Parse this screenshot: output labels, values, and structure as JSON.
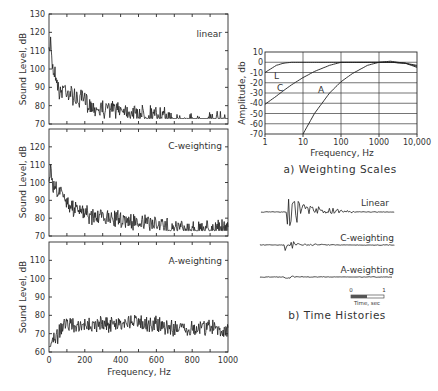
{
  "chart_data": [
    {
      "type": "line",
      "panel": "linear",
      "title": "linear",
      "xlabel": "",
      "ylabel": "Sound Level, dB",
      "xlim": [
        0,
        1000
      ],
      "ylim": [
        70,
        130
      ],
      "yticks": [
        70,
        80,
        90,
        100,
        110,
        120,
        130
      ],
      "grid": false,
      "x": [
        0,
        10,
        20,
        40,
        60,
        80,
        100,
        150,
        200,
        250,
        300,
        400,
        500,
        600,
        700,
        800,
        900,
        1000
      ],
      "values": [
        110,
        120,
        105,
        100,
        90,
        95,
        92,
        88,
        86,
        83,
        82,
        82,
        80,
        79,
        76,
        75,
        76,
        75
      ]
    },
    {
      "type": "line",
      "panel": "C-weighting",
      "title": "C-weighting",
      "ylabel": "Sound Level, dB",
      "xlim": [
        0,
        1000
      ],
      "ylim": [
        70,
        130
      ],
      "yticks": [
        70,
        80,
        90,
        100,
        110,
        120
      ],
      "grid": false,
      "x": [
        0,
        10,
        20,
        40,
        60,
        80,
        100,
        150,
        200,
        250,
        300,
        400,
        500,
        600,
        700,
        800,
        900,
        1000
      ],
      "values": [
        100,
        113,
        102,
        100,
        98,
        96,
        92,
        88,
        86,
        84,
        84,
        83,
        81,
        80,
        78,
        77,
        78,
        77
      ]
    },
    {
      "type": "line",
      "panel": "A-weighting",
      "title": "A-weighting",
      "xlabel": "Frequency, Hz",
      "ylabel": "Sound Level, dB",
      "xlim": [
        0,
        1000
      ],
      "ylim": [
        60,
        120
      ],
      "yticks": [
        60,
        70,
        80,
        90,
        100,
        110
      ],
      "xticks": [
        0,
        200,
        400,
        600,
        800,
        1000
      ],
      "grid": false,
      "x": [
        0,
        10,
        20,
        40,
        60,
        80,
        100,
        150,
        200,
        250,
        300,
        400,
        500,
        600,
        700,
        800,
        900,
        1000
      ],
      "values": [
        65,
        66,
        68,
        72,
        74,
        78,
        80,
        76,
        77,
        79,
        78,
        79,
        80,
        78,
        76,
        76,
        77,
        75
      ]
    },
    {
      "type": "line",
      "panel": "weighting-scales",
      "title": "a) Weighting Scales",
      "xlabel": "Frequency, Hz",
      "ylabel": "Amplitude, db",
      "xscale": "log",
      "xlim": [
        1,
        10000
      ],
      "ylim": [
        -70,
        10
      ],
      "xticks": [
        "1",
        "10",
        "100",
        "1000",
        "10,000"
      ],
      "yticks": [
        10,
        0,
        -10,
        -20,
        -30,
        -40,
        -50,
        -60,
        -70
      ],
      "grid": true,
      "x": [
        1,
        2,
        3,
        5,
        10,
        20,
        50,
        100,
        200,
        500,
        1000,
        2000,
        5000,
        10000
      ],
      "series": [
        {
          "name": "L",
          "values": [
            -10,
            -3,
            -1,
            0,
            0,
            0,
            0,
            0,
            0,
            0,
            0,
            0,
            -1,
            -3
          ]
        },
        {
          "name": "C",
          "values": [
            -41,
            -33,
            -28,
            -22,
            -15,
            -9,
            -3,
            0,
            0,
            0,
            0,
            0,
            -1,
            -4
          ]
        },
        {
          "name": "A",
          "values": [
            null,
            null,
            null,
            null,
            -70,
            -50,
            -30,
            -19,
            -11,
            -3,
            0,
            1,
            -1,
            -5
          ]
        }
      ]
    },
    {
      "type": "line",
      "panel": "time-histories",
      "title": "b) Time Histories",
      "series_labels": [
        "Linear",
        "C-weighting",
        "A-weighting"
      ],
      "scale_bar": {
        "start": "0",
        "end": "1",
        "label": "Time, sec"
      }
    }
  ],
  "figure": {
    "spectra": {
      "ylabel": "Sound Level, dB",
      "xlabel": "Frequency, Hz",
      "panels": [
        {
          "label": "linear",
          "yticks": [
            "130",
            "120",
            "110",
            "100",
            "90",
            "80",
            "70"
          ]
        },
        {
          "label": "C-weighting",
          "yticks": [
            "120",
            "110",
            "100",
            "90",
            "80",
            "70"
          ]
        },
        {
          "label": "A-weighting",
          "yticks": [
            "110",
            "100",
            "90",
            "80",
            "70",
            "60"
          ]
        }
      ],
      "xticks": [
        "0",
        "200",
        "400",
        "600",
        "800",
        "1000"
      ]
    },
    "weighting": {
      "ylabel": "Amplitude, db",
      "xlabel": "Frequency, Hz",
      "caption": "a) Weighting Scales",
      "yticks": [
        "10",
        "0",
        "-10",
        "-20",
        "-30",
        "-40",
        "-50",
        "-60",
        "-70"
      ],
      "xticks": [
        "1",
        "10",
        "100",
        "1000",
        "10,000"
      ],
      "curve_labels": {
        "L": "L",
        "C": "C",
        "A": "A"
      }
    },
    "time": {
      "caption": "b) Time Histories",
      "traces": [
        "Linear",
        "C-weighting",
        "A-weighting"
      ],
      "scale_start": "0",
      "scale_end": "1",
      "scale_label": "Time, sec"
    }
  }
}
